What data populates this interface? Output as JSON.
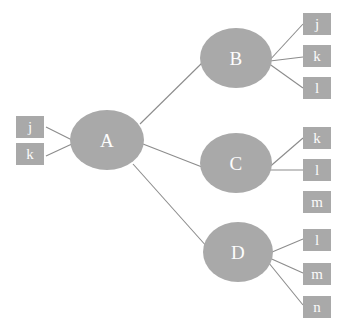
{
  "diagram": {
    "type": "tree-graph",
    "background_color": "#ffffff",
    "node_fill_color": "#a9a9a9",
    "node_text_color": "#fdfdfd",
    "edge_color": "#8c8c8c",
    "nodes": [
      {
        "id": "A",
        "label": "A",
        "shape": "ellipse",
        "x": 70,
        "y": 110,
        "w": 74,
        "h": 60
      },
      {
        "id": "B",
        "label": "B",
        "shape": "ellipse",
        "x": 200,
        "y": 28,
        "w": 72,
        "h": 60
      },
      {
        "id": "C",
        "label": "C",
        "shape": "ellipse",
        "x": 200,
        "y": 133,
        "w": 72,
        "h": 60
      },
      {
        "id": "D",
        "label": "D",
        "shape": "ellipse",
        "x": 203,
        "y": 222,
        "w": 70,
        "h": 60
      }
    ],
    "leaf_groups": [
      {
        "name": "left-inputs",
        "position": "left",
        "boxes": [
          {
            "id": "left-j",
            "label": "j",
            "x": 16,
            "y": 116,
            "w": 28,
            "h": 22
          },
          {
            "id": "left-k",
            "label": "k",
            "x": 16,
            "y": 143,
            "w": 28,
            "h": 22
          }
        ]
      },
      {
        "name": "b-outputs",
        "position": "right",
        "boxes": [
          {
            "id": "b-j",
            "label": "j",
            "x": 303,
            "y": 13,
            "w": 28,
            "h": 22
          },
          {
            "id": "b-k",
            "label": "k",
            "x": 303,
            "y": 45,
            "w": 28,
            "h": 22
          },
          {
            "id": "b-l",
            "label": "l",
            "x": 303,
            "y": 77,
            "w": 28,
            "h": 22
          }
        ]
      },
      {
        "name": "c-outputs",
        "position": "right",
        "boxes": [
          {
            "id": "c-k",
            "label": "k",
            "x": 303,
            "y": 127,
            "w": 28,
            "h": 22
          },
          {
            "id": "c-l",
            "label": "l",
            "x": 303,
            "y": 159,
            "w": 28,
            "h": 22
          },
          {
            "id": "c-m",
            "label": "m",
            "x": 303,
            "y": 191,
            "w": 28,
            "h": 22
          }
        ]
      },
      {
        "name": "d-outputs",
        "position": "right",
        "boxes": [
          {
            "id": "d-l",
            "label": "l",
            "x": 303,
            "y": 229,
            "w": 28,
            "h": 22
          },
          {
            "id": "d-m",
            "label": "m",
            "x": 303,
            "y": 263,
            "w": 28,
            "h": 22
          },
          {
            "id": "d-n",
            "label": "n",
            "x": 303,
            "y": 296,
            "w": 28,
            "h": 22
          }
        ]
      }
    ],
    "edges": [
      {
        "from": "left-j",
        "to": "A",
        "x1": 46,
        "y1": 127,
        "x2": 74,
        "y2": 141
      },
      {
        "from": "left-k",
        "to": "A",
        "x1": 46,
        "y1": 156,
        "x2": 74,
        "y2": 143
      },
      {
        "from": "A",
        "to": "B",
        "x1": 140,
        "y1": 124,
        "x2": 203,
        "y2": 62
      },
      {
        "from": "A",
        "to": "C",
        "x1": 143,
        "y1": 144,
        "x2": 202,
        "y2": 167
      },
      {
        "from": "A",
        "to": "D",
        "x1": 133,
        "y1": 164,
        "x2": 208,
        "y2": 248
      },
      {
        "from": "B",
        "to": "b-j",
        "x1": 268,
        "y1": 62,
        "x2": 303,
        "y2": 24
      },
      {
        "from": "B",
        "to": "b-k",
        "x1": 270,
        "y1": 61,
        "x2": 303,
        "y2": 57
      },
      {
        "from": "B",
        "to": "b-l",
        "x1": 268,
        "y1": 63,
        "x2": 303,
        "y2": 88
      },
      {
        "from": "C",
        "to": "c-k",
        "x1": 266,
        "y1": 170,
        "x2": 303,
        "y2": 138
      },
      {
        "from": "C",
        "to": "c-l",
        "x1": 268,
        "y1": 170,
        "x2": 303,
        "y2": 170
      },
      {
        "from": "D",
        "to": "d-l",
        "x1": 265,
        "y1": 255,
        "x2": 303,
        "y2": 239
      },
      {
        "from": "D",
        "to": "d-m",
        "x1": 265,
        "y1": 256,
        "x2": 303,
        "y2": 273
      },
      {
        "from": "D",
        "to": "d-n",
        "x1": 264,
        "y1": 257,
        "x2": 303,
        "y2": 305
      }
    ]
  }
}
